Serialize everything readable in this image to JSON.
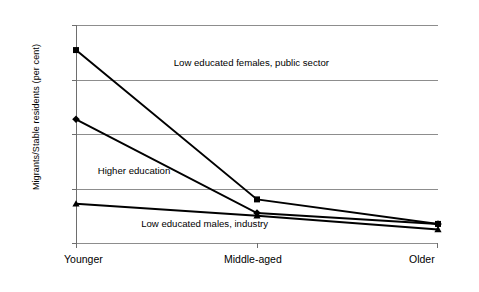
{
  "chart_data": {
    "type": "line",
    "title": "",
    "xlabel": "",
    "ylabel": "Migrants/Stable residents (per cent)",
    "categories": [
      "Younger",
      "Middle-aged",
      "Older"
    ],
    "ylim": [
      0,
      40
    ],
    "yticks": [
      0,
      10,
      20,
      30,
      40
    ],
    "ytick_labels": [
      "0",
      "10",
      "20",
      "30",
      "40"
    ],
    "grid": true,
    "legend": "inline-annotations",
    "series": [
      {
        "name": "Low educated females, public sector",
        "marker": "square",
        "values": [
          35.4,
          8.0,
          3.5
        ]
      },
      {
        "name": "Higher education",
        "marker": "diamond",
        "values": [
          22.7,
          5.5,
          3.5
        ]
      },
      {
        "name": "Low educated males, industry",
        "marker": "triangle",
        "values": [
          7.2,
          5.0,
          2.5
        ]
      }
    ],
    "annotations": [
      {
        "text": "Low educated females, public sector",
        "x": 0.27,
        "y": 33.0
      },
      {
        "text": "Higher education",
        "x": 0.06,
        "y": 13.2
      },
      {
        "text": "Low educated males, industry",
        "x": 0.18,
        "y": 3.4
      }
    ],
    "colors": {
      "line": "#000000",
      "grid": "#8d8d8d",
      "axis": "#6e6e6e",
      "background": "#ffffff"
    }
  }
}
